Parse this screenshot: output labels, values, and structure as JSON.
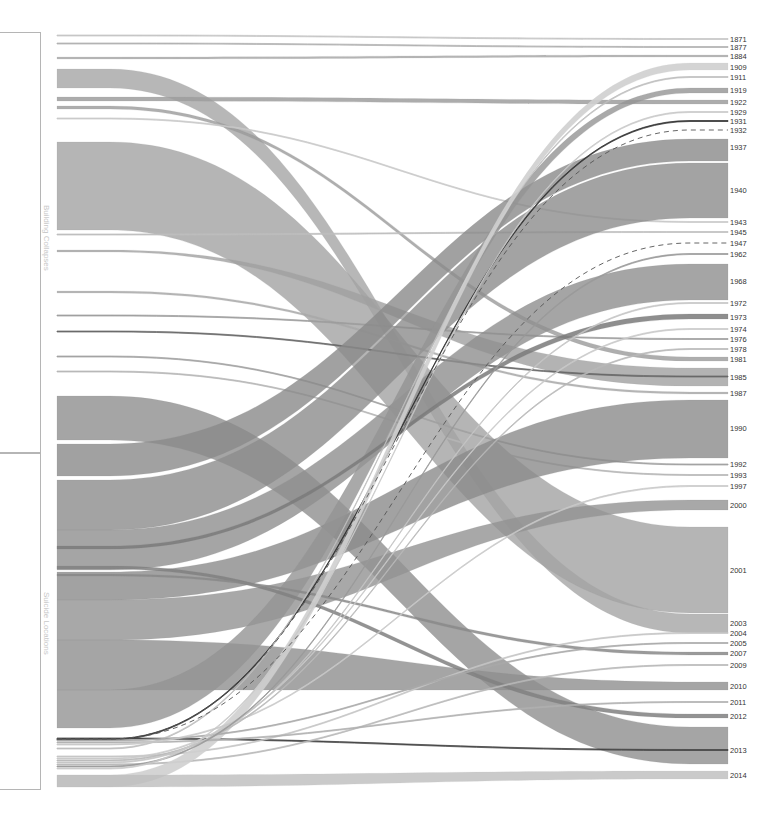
{
  "chart_data": {
    "type": "sankey",
    "title": "",
    "left_groups": [
      {
        "label": "Building Collapses",
        "y0": 32,
        "y1": 452
      },
      {
        "label": "Suicide Locations",
        "y0": 452,
        "y1": 788
      }
    ],
    "right_nodes": [
      {
        "year": "1871",
        "y": 39
      },
      {
        "year": "1877",
        "y": 47
      },
      {
        "year": "1884",
        "y": 56
      },
      {
        "year": "1909",
        "y": 67
      },
      {
        "year": "1911",
        "y": 77
      },
      {
        "year": "1919",
        "y": 90
      },
      {
        "year": "1922",
        "y": 102
      },
      {
        "year": "1929",
        "y": 112
      },
      {
        "year": "1931",
        "y": 121
      },
      {
        "year": "1932",
        "y": 130
      },
      {
        "year": "1937",
        "y": 147
      },
      {
        "year": "1940",
        "y": 190
      },
      {
        "year": "1943",
        "y": 222
      },
      {
        "year": "1945",
        "y": 232
      },
      {
        "year": "1947",
        "y": 243
      },
      {
        "year": "1962",
        "y": 254
      },
      {
        "year": "1968",
        "y": 281
      },
      {
        "year": "1972",
        "y": 303
      },
      {
        "year": "1973",
        "y": 317
      },
      {
        "year": "1974",
        "y": 329
      },
      {
        "year": "1976",
        "y": 339
      },
      {
        "year": "1978",
        "y": 349
      },
      {
        "year": "1981",
        "y": 359
      },
      {
        "year": "1985",
        "y": 377
      },
      {
        "year": "1987",
        "y": 393
      },
      {
        "year": "1990",
        "y": 428
      },
      {
        "year": "1992",
        "y": 464
      },
      {
        "year": "1993",
        "y": 475
      },
      {
        "year": "1997",
        "y": 486
      },
      {
        "year": "2000",
        "y": 505
      },
      {
        "year": "2001",
        "y": 570
      },
      {
        "year": "2003",
        "y": 623
      },
      {
        "year": "2004",
        "y": 633
      },
      {
        "year": "2005",
        "y": 643
      },
      {
        "year": "2007",
        "y": 653
      },
      {
        "year": "2009",
        "y": 665
      },
      {
        "year": "2010",
        "y": 686
      },
      {
        "year": "2011",
        "y": 702
      },
      {
        "year": "2012",
        "y": 716
      },
      {
        "year": "2013",
        "y": 750
      },
      {
        "year": "2014",
        "y": 775
      }
    ],
    "flows": [
      {
        "ly0": 35,
        "ly1": 36,
        "ry0": 38.5,
        "ry1": 39.5,
        "fill": "#c4c4c4",
        "op": 0.9
      },
      {
        "ly0": 43,
        "ly1": 44,
        "ry0": 46.5,
        "ry1": 47.5,
        "fill": "#b0b0b0",
        "op": 0.9
      },
      {
        "ly0": 57,
        "ly1": 59,
        "ry0": 55,
        "ry1": 57,
        "fill": "#a8a8a8",
        "op": 0.85
      },
      {
        "ly0": 69,
        "ly1": 88,
        "ry0": 614,
        "ry1": 633,
        "fill": "#a5a5a5",
        "op": 0.8
      },
      {
        "ly0": 97,
        "ly1": 101,
        "ry0": 100,
        "ry1": 104,
        "fill": "#9e9e9e",
        "op": 0.85
      },
      {
        "ly0": 106,
        "ly1": 109,
        "ry0": 357,
        "ry1": 361,
        "fill": "#9a9a9a",
        "op": 0.8
      },
      {
        "ly0": 118,
        "ly1": 119,
        "ry0": 221.5,
        "ry1": 222.5,
        "fill": "#c8c8c8",
        "op": 0.9
      },
      {
        "ly0": 142,
        "ly1": 230,
        "ry0": 527,
        "ry1": 613,
        "fill": "#a2a2a2",
        "op": 0.8
      },
      {
        "ly0": 234,
        "ly1": 235,
        "ry0": 231.5,
        "ry1": 232.5,
        "fill": "#bdbdbd",
        "op": 0.9
      },
      {
        "ly0": 250,
        "ly1": 252,
        "ry0": 368,
        "ry1": 386,
        "fill": "#a0a0a0",
        "op": 0.8
      },
      {
        "ly0": 291,
        "ly1": 293,
        "ry0": 392,
        "ry1": 394,
        "fill": "#a8a8a8",
        "op": 0.85
      },
      {
        "ly0": 315,
        "ly1": 316,
        "ry0": 338.5,
        "ry1": 339.5,
        "fill": "#9c9c9c",
        "op": 0.9
      },
      {
        "ly0": 331,
        "ly1": 332,
        "ry0": 376,
        "ry1": 377,
        "fill": "#666666",
        "op": 0.9
      },
      {
        "ly0": 356,
        "ly1": 357,
        "ry0": 464,
        "ry1": 465,
        "fill": "#a0a0a0",
        "op": 0.9
      },
      {
        "ly0": 371,
        "ly1": 372,
        "ry0": 474.5,
        "ry1": 475.5,
        "fill": "#b5b5b5",
        "op": 0.9
      },
      {
        "ly0": 396,
        "ly1": 440,
        "ry0": 727,
        "ry1": 764,
        "fill": "#8e8e8e",
        "op": 0.8
      },
      {
        "ly0": 444,
        "ly1": 476,
        "ry0": 139,
        "ry1": 161,
        "fill": "#8a8a8a",
        "op": 0.8
      },
      {
        "ly0": 480,
        "ly1": 530,
        "ry0": 163,
        "ry1": 218,
        "fill": "#8c8c8c",
        "op": 0.8
      },
      {
        "ly0": 530,
        "ly1": 570,
        "ry0": 264,
        "ry1": 300,
        "fill": "#8e8e8e",
        "op": 0.8
      },
      {
        "ly0": 572,
        "ly1": 600,
        "ry0": 400,
        "ry1": 458,
        "fill": "#8b8b8b",
        "op": 0.8
      },
      {
        "ly0": 600,
        "ly1": 640,
        "ry0": 500,
        "ry1": 510,
        "fill": "#929292",
        "op": 0.8
      },
      {
        "ly0": 640,
        "ly1": 690,
        "ry0": 682,
        "ry1": 690,
        "fill": "#8f8f8f",
        "op": 0.8
      },
      {
        "ly0": 690,
        "ly1": 728,
        "ry0": 88,
        "ry1": 93,
        "fill": "#949494",
        "op": 0.8
      },
      {
        "ly0": 546,
        "ly1": 549,
        "ry0": 314,
        "ry1": 319,
        "fill": "#7a7a7a",
        "op": 0.85
      },
      {
        "ly0": 566,
        "ly1": 569,
        "ry0": 714,
        "ry1": 718,
        "fill": "#808080",
        "op": 0.85
      },
      {
        "ly0": 574,
        "ly1": 576,
        "ry0": 652,
        "ry1": 655,
        "fill": "#888888",
        "op": 0.85
      },
      {
        "ly0": 739,
        "ly1": 740,
        "ry0": 120.5,
        "ry1": 121.5,
        "fill": "#333333",
        "op": 0.95
      },
      {
        "ly0": 738,
        "ly1": 739,
        "ry0": 749.5,
        "ry1": 750.5,
        "fill": "#444444",
        "op": 0.95
      },
      {
        "ly0": 748,
        "ly1": 749,
        "ry0": 76.5,
        "ry1": 77.5,
        "fill": "#bdbdbd",
        "op": 0.9
      },
      {
        "ly0": 756,
        "ly1": 757,
        "ry0": 632.5,
        "ry1": 633.5,
        "fill": "#c4c4c4",
        "op": 0.9
      },
      {
        "ly0": 764,
        "ly1": 765,
        "ry0": 664.5,
        "ry1": 665.5,
        "fill": "#b8b8b8",
        "op": 0.9
      },
      {
        "ly0": 775,
        "ly1": 787,
        "ry0": 63,
        "ry1": 70,
        "fill": "#cfcfcf",
        "op": 0.9
      },
      {
        "ly0": 775,
        "ly1": 787,
        "ry0": 771,
        "ry1": 779,
        "fill": "#bdbdbd",
        "op": 0.8
      },
      {
        "ly0": 740,
        "ly1": 741,
        "ry0": 642.5,
        "ry1": 643.5,
        "fill": "#a8a8a8",
        "op": 0.9
      },
      {
        "ly0": 742,
        "ly1": 743,
        "ry0": 701.5,
        "ry1": 702.5,
        "fill": "#b0b0b0",
        "op": 0.9
      },
      {
        "ly0": 744,
        "ly1": 745,
        "ry0": 485.5,
        "ry1": 486.5,
        "fill": "#c8c8c8",
        "op": 0.9
      },
      {
        "ly0": 758,
        "ly1": 759,
        "ry0": 328.5,
        "ry1": 329.5,
        "fill": "#c8c8c8",
        "op": 0.9
      },
      {
        "ly0": 760,
        "ly1": 761,
        "ry0": 348.5,
        "ry1": 349.5,
        "fill": "#b8b8b8",
        "op": 0.9
      },
      {
        "ly0": 762,
        "ly1": 763,
        "ry0": 302.5,
        "ry1": 303.5,
        "fill": "#c4c4c4",
        "op": 0.9
      },
      {
        "ly0": 766,
        "ly1": 767,
        "ry0": 253.5,
        "ry1": 254.5,
        "fill": "#999999",
        "op": 0.9
      },
      {
        "ly0": 768,
        "ly1": 769,
        "ry0": 111.5,
        "ry1": 112.5,
        "fill": "#c8c8c8",
        "op": 0.9
      }
    ],
    "dashed_flows": [
      {
        "ly": 739,
        "ry": 130,
        "stroke": "#555555"
      },
      {
        "ly": 739,
        "ry": 243,
        "stroke": "#555555"
      }
    ]
  }
}
